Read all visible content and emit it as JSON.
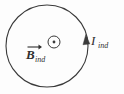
{
  "figure": {
    "background_color": "#fdfdfd",
    "stroke_color": "#3a3a3a",
    "text_color": "#2f2f2f"
  },
  "loop": {
    "name": "current-loop",
    "shape": "circle",
    "center_x": 47,
    "center_y": 46,
    "radius": 41,
    "stroke_width": 1.1
  },
  "field_symbol": {
    "name": "field-out-of-page-symbol",
    "glyph": "circle-dot",
    "meaning": "out-of-page",
    "center_x": 54,
    "center_y": 42,
    "outer_radius": 6,
    "dot_radius": 1.4
  },
  "current_arrow": {
    "name": "current-direction-arrow",
    "direction": "counterclockwise-up",
    "tip_x": 86,
    "tip_y": 36
  },
  "labels": {
    "b_field": {
      "symbol": "B",
      "subscript": "ind",
      "full": "B_ind",
      "has_vector_arrow": true
    },
    "current": {
      "symbol": "I",
      "subscript": "ind",
      "full": "I_ind",
      "has_vector_arrow": false
    }
  }
}
